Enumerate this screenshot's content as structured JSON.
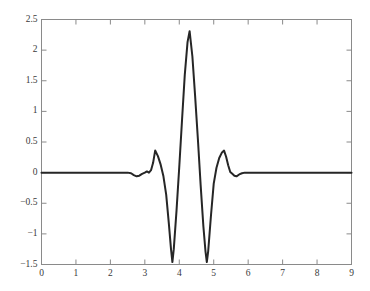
{
  "chart_data": {
    "type": "line",
    "title": "",
    "xlabel": "",
    "ylabel": "",
    "xlim": [
      0,
      9
    ],
    "ylim": [
      -1.5,
      2.5
    ],
    "grid": false,
    "legend": false,
    "line_color": "#262626",
    "line_width": 2,
    "axis_color": "#8a8a8a",
    "background": "#ffffff",
    "xticks": [
      0,
      1,
      2,
      3,
      4,
      5,
      6,
      7,
      8,
      9
    ],
    "xtick_labels": [
      "0",
      "1",
      "2",
      "3",
      "4",
      "5",
      "6",
      "7",
      "8",
      "9"
    ],
    "yticks": [
      -1.5,
      -1,
      -0.5,
      0,
      0.5,
      1,
      1.5,
      2,
      2.5
    ],
    "ytick_labels": [
      "−1.5",
      "−1",
      "−0.5",
      "0",
      "0.5",
      "1",
      "1.5",
      "2",
      "2.5"
    ],
    "series": [
      {
        "name": "wavelet",
        "x": [
          0.0,
          0.3,
          0.6,
          0.9,
          1.2,
          1.5,
          1.8,
          2.1,
          2.35,
          2.5,
          2.6,
          2.68,
          2.76,
          2.84,
          2.92,
          3.0,
          3.06,
          3.12,
          3.18,
          3.24,
          3.3,
          3.38,
          3.46,
          3.54,
          3.62,
          3.7,
          3.76,
          3.8,
          3.84,
          3.92,
          4.0,
          4.08,
          4.16,
          4.24,
          4.3,
          4.38,
          4.46,
          4.54,
          4.62,
          4.7,
          4.76,
          4.8,
          4.84,
          4.92,
          5.0,
          5.08,
          5.16,
          5.24,
          5.3,
          5.36,
          5.42,
          5.48,
          5.54,
          5.6,
          5.66,
          5.74,
          5.82,
          5.9,
          6.0,
          6.2,
          6.5,
          6.9,
          7.3,
          7.7,
          8.1,
          8.5,
          8.8,
          9.0
        ],
        "y": [
          0.0,
          0.0,
          0.0,
          0.0,
          0.0,
          0.0,
          0.0,
          0.0,
          0.0,
          0.0,
          -0.01,
          -0.04,
          -0.06,
          -0.05,
          -0.02,
          0.0,
          0.02,
          0.0,
          0.04,
          0.16,
          0.36,
          0.27,
          0.13,
          -0.06,
          -0.36,
          -0.85,
          -1.25,
          -1.46,
          -1.25,
          -0.62,
          0.1,
          0.86,
          1.6,
          2.13,
          2.31,
          1.9,
          1.25,
          0.55,
          -0.2,
          -0.88,
          -1.28,
          -1.46,
          -1.28,
          -0.7,
          -0.18,
          0.08,
          0.24,
          0.33,
          0.36,
          0.26,
          0.12,
          0.01,
          -0.02,
          -0.05,
          -0.06,
          -0.03,
          -0.01,
          0.0,
          0.0,
          0.0,
          0.0,
          0.0,
          0.0,
          0.0,
          0.0,
          0.0,
          0.0,
          0.0
        ],
        "color": "#262626"
      }
    ],
    "annotations": {
      "peak_value": 2.31,
      "peak_x": 4.3,
      "trough_left_value": -1.46,
      "trough_left_x": 3.8,
      "trough_right_value": -1.46,
      "trough_right_x": 4.8,
      "side_peak_left_value": 0.36,
      "side_peak_left_x": 3.3,
      "side_peak_right_value": 0.36,
      "side_peak_right_x": 5.3
    }
  }
}
